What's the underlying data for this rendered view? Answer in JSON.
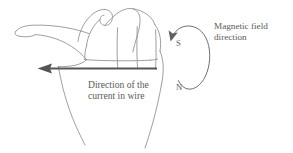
{
  "figure": {
    "background_color": "#ffffff",
    "line_color": "#8d8d93",
    "arrow_color": "#555559",
    "text_color": "#5a5a5a"
  },
  "labels": {
    "magnetic_field": {
      "line1": "Magnetic field",
      "line2": "direction"
    },
    "current_direction": {
      "line1": "Direction of the",
      "line2": "current in wire"
    },
    "pole_south": "S",
    "pole_north": "N"
  },
  "diagram_elements": {
    "hand_label": "right-hand-outline",
    "thumb_label": "thumb-pointing-left",
    "fingers_label": "curled-fingers",
    "current_arrow_label": "current-arrow-pointing-left",
    "field_loop_label": "magnetic-field-loop-clockwise"
  }
}
